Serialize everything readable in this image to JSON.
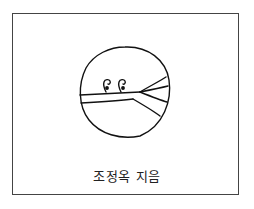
{
  "illustration": {
    "description": "Hand-drawn circle containing a horizontal band that splits into branches on the right, with two small curl (cloud) marks above the band",
    "stroke_color": "#111111",
    "frame_color": "#444444"
  },
  "caption": {
    "author_line": "조정옥 지음"
  }
}
